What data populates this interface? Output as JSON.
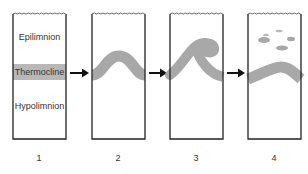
{
  "diagram": {
    "type": "thermocline-mixing-sequence",
    "panels": [
      {
        "number": "1",
        "layers": [
          "Epilimnion",
          "Thermocline",
          "Hypolimnion"
        ],
        "state": "stratified"
      },
      {
        "number": "2",
        "state": "thermocline-wave"
      },
      {
        "number": "3",
        "state": "wave-breaking"
      },
      {
        "number": "4",
        "state": "mixed-with-patches"
      }
    ],
    "labels": {
      "epilimnion": "Epilimnion",
      "thermocline": "Thermocline",
      "hypolimnion": "Hypolimnion"
    },
    "numbers": [
      "1",
      "2",
      "3",
      "4"
    ],
    "colors": {
      "outline": "#222222",
      "thermocline_band": "#a8a8a8",
      "band_box1": "#b8b8b8"
    }
  }
}
